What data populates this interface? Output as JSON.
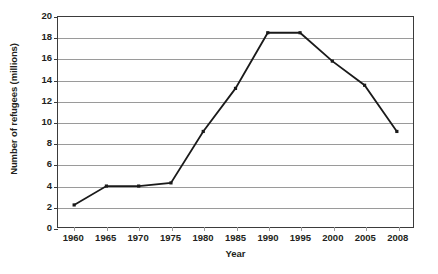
{
  "chart_data": {
    "type": "line",
    "title": "",
    "xlabel": "Year",
    "ylabel": "Number of refugees (millions)",
    "categories": [
      "1960",
      "1965",
      "1970",
      "1975",
      "1980",
      "1985",
      "1990",
      "1995",
      "2000",
      "2005",
      "2008"
    ],
    "values": [
      2.1,
      3.9,
      3.9,
      4.2,
      9.1,
      13.2,
      18.5,
      18.5,
      15.8,
      13.5,
      9.1
    ],
    "series": [
      {
        "name": "Number of refugees",
        "values": [
          2.1,
          3.9,
          3.9,
          4.2,
          9.1,
          13.2,
          18.5,
          18.5,
          15.8,
          13.5,
          9.1
        ]
      }
    ],
    "ylim": [
      0,
      20
    ],
    "yticks": [
      "0",
      "2",
      "4",
      "6",
      "8",
      "10",
      "12",
      "14",
      "16",
      "18",
      "20"
    ],
    "ytick_values": [
      0,
      2,
      4,
      6,
      8,
      10,
      12,
      14,
      16,
      18,
      20
    ],
    "grid": "horizontal",
    "legend": "none",
    "line_color": "#1a1a1a",
    "marker": "square",
    "marker_color": "#1a1a1a",
    "gridline_color": "#9a9a9a",
    "axis_color": "#3b3b3b",
    "background": "#ffffff"
  }
}
